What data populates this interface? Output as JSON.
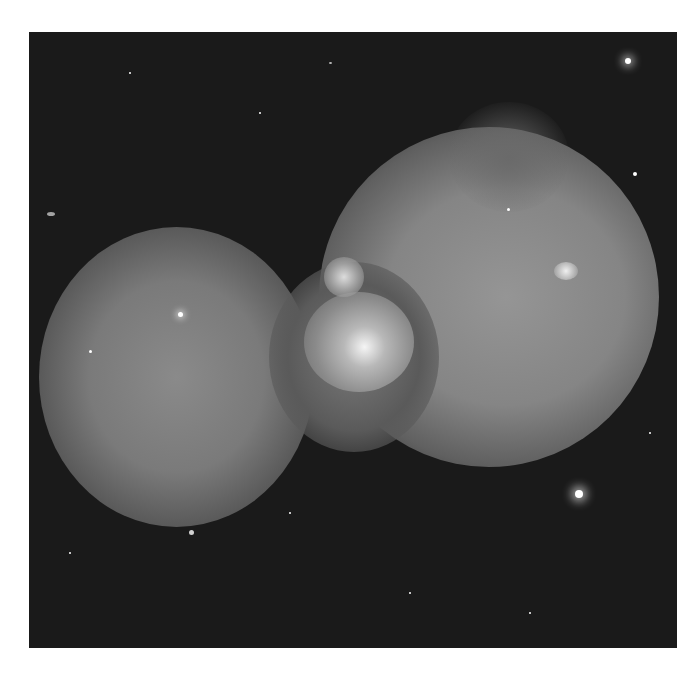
{
  "image": {
    "description": "Grayscale astronomical image of a bipolar nebula with two large lobes and a bright central region against a starfield",
    "colors": {
      "background": "#1a1a1a",
      "nebula": "#9a9a9a",
      "core": "#e0e0e0",
      "page": "#ffffff"
    }
  }
}
